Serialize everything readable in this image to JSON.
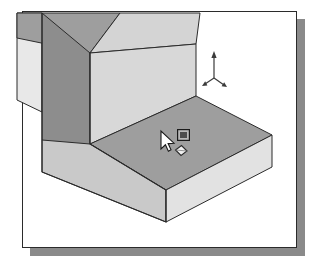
{
  "app": {
    "title": "3D Isometric Model Viewport",
    "background_color": "#ffffff"
  },
  "document_frame": {
    "name": "viewport-page",
    "border_color": "#2b2b2b",
    "fill_color": "#ffffff",
    "shadow_color": "#8a8a8a",
    "x": 22,
    "y": 11,
    "width": 275,
    "height": 237
  },
  "model": {
    "name": "L-shaped-block",
    "description": "L-shaped extruded solid shown in isometric projection",
    "outline_color": "#2b2b2b",
    "faces": [
      {
        "name": "top-face-slab",
        "role": "horizontal-top",
        "color": "#9e9e9e"
      },
      {
        "name": "top-face-upright",
        "role": "horizontal-top",
        "color": "#9e9e9e"
      },
      {
        "name": "front-left-face-upright",
        "role": "vertical-left",
        "color": "#8d8d8d"
      },
      {
        "name": "front-right-face-upright",
        "role": "vertical-right",
        "color": "#d8d8d8"
      },
      {
        "name": "front-left-face-slab",
        "role": "vertical-left",
        "color": "#c9c9c9"
      },
      {
        "name": "front-right-face-slab",
        "role": "vertical-right",
        "color": "#e2e2e2"
      },
      {
        "name": "back-face-sliver",
        "role": "vertical-back",
        "color": "#e8e8e8"
      }
    ]
  },
  "axis_indicator": {
    "name": "coordinate-triad",
    "color": "#3a3a3a",
    "axes": [
      {
        "label": "Z",
        "direction": "up"
      },
      {
        "label": "X",
        "direction": "down-left"
      },
      {
        "label": "Y",
        "direction": "down-right"
      }
    ]
  },
  "cursor": {
    "name": "face-select-cursor",
    "arrow_fill": "#ffffff",
    "arrow_stroke": "#1a1a1a",
    "badge_label": "filled-square",
    "badge_fill": "#5a5a5a",
    "badge_stroke": "#1a1a1a",
    "hint_label": "diamond-outline",
    "hint_stroke": "#2b2b2b",
    "hint_fill": "#f2f2f2"
  }
}
